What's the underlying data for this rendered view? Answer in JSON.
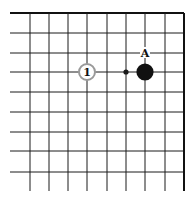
{
  "diagram": {
    "type": "go-board-fragment",
    "line_color": "#1a1a1a",
    "edge_line_color": "#111111",
    "grid": {
      "x_lines": [
        30,
        49,
        68,
        87,
        107,
        126,
        145,
        165,
        184
      ],
      "y_lines": [
        13,
        33,
        53,
        72,
        92,
        112,
        132,
        151,
        172
      ],
      "h_line_start_x": 10,
      "v_line_end_y": 191,
      "top_edge": true,
      "right_edge": true
    },
    "star_points": [
      {
        "x": 126,
        "y": 72
      }
    ],
    "stones": [
      {
        "color": "white",
        "x": 87,
        "y": 72,
        "label": "1",
        "border_color": "#9a9a9a",
        "fill": "#ffffff"
      },
      {
        "color": "black",
        "x": 145,
        "y": 72,
        "label": "",
        "fill": "#111111"
      }
    ],
    "markers": [
      {
        "type": "letter",
        "x": 145,
        "y": 53,
        "label": "A"
      }
    ]
  }
}
